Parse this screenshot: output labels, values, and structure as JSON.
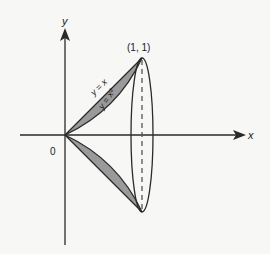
{
  "diagram": {
    "type": "solid-of-revolution",
    "axes": {
      "x_label": "x",
      "y_label": "y",
      "origin_label": "0"
    },
    "point": {
      "label": "(1, 1)"
    },
    "curves": [
      {
        "label": "y = x",
        "kind": "line"
      },
      {
        "label": "y = x²",
        "kind": "parabola"
      }
    ],
    "colors": {
      "background": "#f7f7f5",
      "stroke": "#2a2a2a",
      "fill": "#9a9a9a"
    }
  }
}
